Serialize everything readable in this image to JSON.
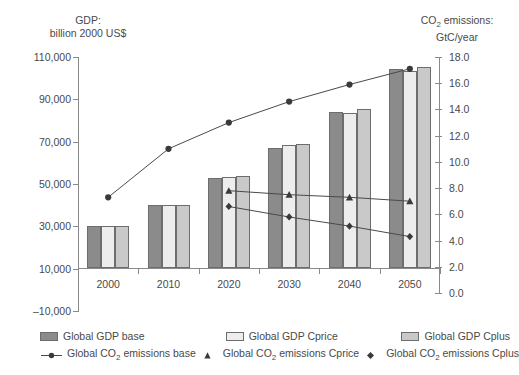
{
  "chart_data": {
    "type": "bar",
    "title": "",
    "left_axis_title_line1": "GDP:",
    "left_axis_title_line2": "billion 2000 US$",
    "right_axis_title_line1": "CO₂ emissions:",
    "right_axis_title_line2": "GtC/year",
    "xlabel": "",
    "ylabel": "GDP: billion 2000 US$",
    "y2label": "CO2 emissions: GtC/year",
    "categories": [
      "2000",
      "2010",
      "2020",
      "2030",
      "2040",
      "2050"
    ],
    "ylim": [
      -10000,
      110000
    ],
    "yticks": [
      -10000,
      10000,
      30000,
      50000,
      70000,
      90000,
      110000
    ],
    "ytick_labels": [
      "–10,000",
      "10,000",
      "30,000",
      "50,000",
      "70,000",
      "90,000",
      "110,000"
    ],
    "y2lim": [
      0.0,
      18.0
    ],
    "y2ticks": [
      0.0,
      2.0,
      4.0,
      6.0,
      8.0,
      10.0,
      12.0,
      14.0,
      16.0,
      18.0
    ],
    "y2tick_labels": [
      "0.0",
      "2.0",
      "4.0",
      "6.0",
      "8.0",
      "10.0",
      "12.0",
      "14.0",
      "16.0",
      "18.0"
    ],
    "grid": false,
    "legend_position": "bottom",
    "bar_series": [
      {
        "name": "Global GDP base",
        "axis": "left",
        "color": "#8b8b8b",
        "values": [
          30000,
          40200,
          52800,
          67000,
          84000,
          104500
        ]
      },
      {
        "name": "Global GDP Cprice",
        "axis": "left",
        "color": "#ededed",
        "values": [
          30000,
          40000,
          53500,
          68500,
          83500,
          103500
        ]
      },
      {
        "name": "Global GDP Cplus",
        "axis": "left",
        "color": "#c9c9c9",
        "values": [
          30000,
          40000,
          53800,
          69000,
          85500,
          105500
        ]
      }
    ],
    "line_series": [
      {
        "name": "Global CO2 emissions base",
        "axis": "right",
        "marker": "circle",
        "color": "#4a4a4a",
        "values": [
          7.3,
          11.0,
          13.0,
          14.6,
          15.9,
          17.1
        ]
      },
      {
        "name": "Global CO2 emissions Cprice",
        "axis": "right",
        "marker": "triangle",
        "color": "#4a4a4a",
        "values": [
          null,
          null,
          7.8,
          7.5,
          7.3,
          7.0
        ]
      },
      {
        "name": "Global CO2 emissions Cplus",
        "axis": "right",
        "marker": "diamond",
        "color": "#4a4a4a",
        "values": [
          null,
          null,
          6.6,
          5.8,
          5.1,
          4.3
        ]
      }
    ]
  },
  "legend": {
    "gdp_base": "Global GDP base",
    "gdp_cprice": "Global GDP Cprice",
    "gdp_cplus": "Global GDP Cplus",
    "co2_base_pre": "Global CO",
    "co2_base_sub": "2",
    "co2_base_post": " emissions base",
    "co2_cprice_pre": "Global CO",
    "co2_cprice_sub": "2",
    "co2_cprice_post": " emissions Cprice",
    "co2_cplus_pre": "Global CO",
    "co2_cplus_sub": "2",
    "co2_cplus_post": " emissions Cplus"
  },
  "axis_titles": {
    "left_l1": "GDP:",
    "left_l2": "billion 2000 US$",
    "right_l1_pre": "CO",
    "right_l1_sub": "2",
    "right_l1_post": " emissions:",
    "right_l2": "GtC/year"
  }
}
